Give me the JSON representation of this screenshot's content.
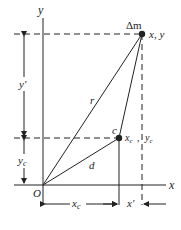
{
  "diagram": {
    "axes": {
      "x_label": "x",
      "y_label": "y",
      "origin_label": "O"
    },
    "points": {
      "mass": {
        "label": "Δm",
        "coord_label": "x, y"
      },
      "center": {
        "label": "c",
        "coord_label_x": "x",
        "coord_label_x_sub": "c",
        "coord_label_y": "y",
        "coord_label_y_sub": "c"
      }
    },
    "vectors": {
      "r": "r",
      "d": "d"
    },
    "dimensions": {
      "y_prime": "y′",
      "y_c": "y",
      "y_c_sub": "c",
      "x_c": "x",
      "x_c_sub": "c",
      "x_prime": "x′"
    },
    "colors": {
      "ink": "#222222",
      "background": "#ffffff"
    }
  }
}
